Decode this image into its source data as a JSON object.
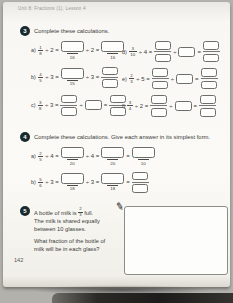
{
  "page": {
    "header": "Unit 8: Fractions (1), Lesson 4",
    "page_number": "142"
  },
  "q3": {
    "number": "3",
    "prompt": "Complete these calculations.",
    "parts": [
      {
        "label": "a)",
        "col": 0,
        "tokens": [
          {
            "t": "pfrac",
            "n": "1",
            "d": "8"
          },
          {
            "t": "op",
            "v": "÷ 2 ="
          },
          {
            "t": "boxu",
            "u": "16"
          },
          {
            "t": "op",
            "v": "÷ 2 ="
          },
          {
            "t": "boxu",
            "u": "16"
          }
        ]
      },
      {
        "label": "b)",
        "col": 0,
        "tokens": [
          {
            "t": "pfrac",
            "n": "4",
            "d": "5"
          },
          {
            "t": "op",
            "v": "÷ 3 ="
          },
          {
            "t": "boxu",
            "u": "15"
          },
          {
            "t": "op",
            "v": "÷ 3 ="
          },
          {
            "t": "fracbox"
          }
        ]
      },
      {
        "label": "c)",
        "col": 0,
        "tokens": [
          {
            "t": "pfrac",
            "n": "3",
            "d": "8"
          },
          {
            "t": "op",
            "v": "÷ 3 ="
          },
          {
            "t": "fracbox"
          },
          {
            "t": "op",
            "v": "÷"
          },
          {
            "t": "box"
          },
          {
            "t": "op",
            "v": "="
          },
          {
            "t": "fracbox"
          }
        ]
      },
      {
        "label": "d)",
        "col": 1,
        "tokens": [
          {
            "t": "pfrac",
            "n": "3",
            "d": "10"
          },
          {
            "t": "op",
            "v": "÷ 4 ="
          },
          {
            "t": "fracbox"
          },
          {
            "t": "op",
            "v": "÷"
          },
          {
            "t": "box"
          },
          {
            "t": "op",
            "v": "="
          },
          {
            "t": "fracbox"
          }
        ]
      },
      {
        "label": "e)",
        "col": 1,
        "tokens": [
          {
            "t": "pfrac",
            "n": "2",
            "d": "3"
          },
          {
            "t": "op",
            "v": "÷ 5 ="
          },
          {
            "t": "fracbox"
          },
          {
            "t": "op",
            "v": "÷"
          },
          {
            "t": "box"
          },
          {
            "t": "op",
            "v": "="
          },
          {
            "t": "fracbox"
          }
        ]
      },
      {
        "label": "f)",
        "col": 1,
        "tokens": [
          {
            "t": "pfrac",
            "n": "3",
            "d": "4"
          },
          {
            "t": "op",
            "v": "÷ 2 ="
          },
          {
            "t": "fracbox"
          },
          {
            "t": "op",
            "v": "÷"
          },
          {
            "t": "box"
          },
          {
            "t": "op",
            "v": "="
          },
          {
            "t": "fracbox"
          }
        ]
      }
    ]
  },
  "q4": {
    "number": "4",
    "prompt": "Complete these calculations. Give each answer in its simplest form.",
    "parts": [
      {
        "label": "a)",
        "tokens": [
          {
            "t": "pfrac",
            "n": "2",
            "d": "5"
          },
          {
            "t": "op",
            "v": "÷ 4 ="
          },
          {
            "t": "boxu",
            "u": "20"
          },
          {
            "t": "op",
            "v": "÷ 4 ="
          },
          {
            "t": "boxu",
            "u": "20"
          },
          {
            "t": "op",
            "v": "="
          },
          {
            "t": "boxu",
            "u": "10"
          }
        ]
      },
      {
        "label": "b)",
        "tokens": [
          {
            "t": "pfrac",
            "n": "5",
            "d": "6"
          },
          {
            "t": "op",
            "v": "÷ 3 ="
          },
          {
            "t": "boxu",
            "u": "18"
          },
          {
            "t": "op",
            "v": "÷ 3 ="
          },
          {
            "t": "boxu",
            "u": "18"
          },
          {
            "t": "op",
            "v": "="
          },
          {
            "t": "fracbox"
          }
        ]
      }
    ]
  },
  "q5": {
    "number": "5",
    "line1_before": "A bottle of milk is",
    "frac": {
      "n": "2",
      "d": "3"
    },
    "line1_after": "full.",
    "line2": "The milk is shared equally",
    "line3": "between 10 glasses.",
    "line4": "What fraction of the bottle of",
    "line5": "milk will be in each glass?",
    "pencil_icon": "pencil"
  }
}
